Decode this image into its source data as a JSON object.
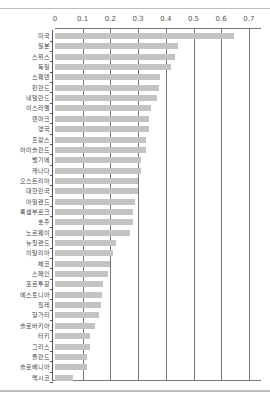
{
  "chart_data": {
    "type": "bar",
    "orientation": "horizontal",
    "title": "",
    "xlabel": "",
    "ylabel": "",
    "xlim": [
      0,
      0.7
    ],
    "x_ticks": [
      "0",
      "0.1",
      "0.2",
      "0.3",
      "0.4",
      "0.5",
      "0.6",
      "0.7"
    ],
    "grid": true,
    "legend": null,
    "bar_color": "#c3c3c3",
    "categories": [
      "미국",
      "일본",
      "스위스",
      "독일",
      "스웨덴",
      "핀란드",
      "네덜란드",
      "이스라엘",
      "덴마크",
      "영국",
      "프랑스",
      "아이슬란드",
      "벨기에",
      "캐나다",
      "오스트리아",
      "대한민국",
      "아일랜드",
      "룩셈부르크",
      "호주",
      "노르웨이",
      "뉴질랜드",
      "이탈리아",
      "체코",
      "스페인",
      "포르투갈",
      "에스토니아",
      "칠레",
      "헝가리",
      "슬로바키아",
      "터키",
      "그리스",
      "폴란드",
      "슬로베니아",
      "멕시코"
    ],
    "values": [
      0.645,
      0.445,
      0.435,
      0.42,
      0.38,
      0.375,
      0.37,
      0.345,
      0.34,
      0.34,
      0.33,
      0.33,
      0.31,
      0.31,
      0.3,
      0.3,
      0.29,
      0.28,
      0.28,
      0.27,
      0.22,
      0.21,
      0.2,
      0.19,
      0.175,
      0.17,
      0.165,
      0.16,
      0.145,
      0.125,
      0.125,
      0.115,
      0.115,
      0.065
    ]
  }
}
